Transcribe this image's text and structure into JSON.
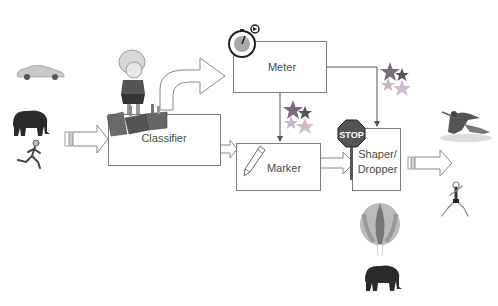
{
  "diagram": {
    "type": "traffic-conditioning-pipeline",
    "nodes": [
      {
        "id": "classifier",
        "label": "Classifier"
      },
      {
        "id": "meter",
        "label": "Meter"
      },
      {
        "id": "marker",
        "label": "Marker"
      },
      {
        "id": "shaper",
        "label": "Shaper/\nDropper",
        "label_line1": "Shaper/",
        "label_line2": "Dropper"
      }
    ],
    "edges": [
      {
        "from": "input",
        "to": "classifier",
        "style": "block-arrow"
      },
      {
        "from": "classifier",
        "to": "meter",
        "style": "curved-block-arrow"
      },
      {
        "from": "classifier",
        "to": "marker",
        "style": "block-arrow"
      },
      {
        "from": "meter",
        "to": "marker",
        "style": "line-arrow"
      },
      {
        "from": "meter",
        "to": "shaper",
        "style": "line-arrow"
      },
      {
        "from": "marker",
        "to": "shaper",
        "style": "block-arrow"
      },
      {
        "from": "shaper",
        "to": "output",
        "style": "block-arrow"
      }
    ],
    "input_icons": [
      "car-icon",
      "elephant-icon",
      "runner-icon"
    ],
    "output_icons": [
      "skaters-icon",
      "runner-icon"
    ],
    "dropped_icons": [
      "hot-air-balloon-icon",
      "elephant-icon"
    ],
    "decorations": {
      "classifier": "girl-sorting-bins-icon",
      "meter": "stopwatch-icon",
      "marker": "pencil-icon",
      "shaper": "stop-sign-icon",
      "marker_stars": "stars-icon",
      "shaper_stars": "stars-icon"
    },
    "stop_sign_text": "STOP"
  },
  "colors": {
    "box_border": "#7a7a7a",
    "text": "#4a4a4a",
    "line": "#555555",
    "star_dark": "#8a7a8a",
    "star_light": "#c8b8c0",
    "stop_red": "#555555"
  }
}
